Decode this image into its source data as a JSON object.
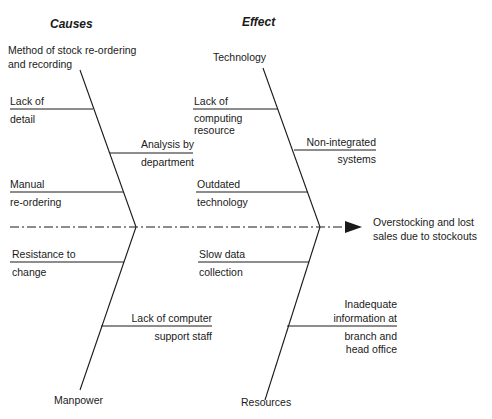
{
  "headers": {
    "causes": "Causes",
    "effect": "Effect"
  },
  "effect_label": {
    "line1": "Overstocking and lost",
    "line2": "sales due to stockouts"
  },
  "categories": {
    "method": {
      "line1": "Method of stock re-ordering",
      "line2": "and recording"
    },
    "technology": "Technology",
    "manpower": "Manpower",
    "resources": "Resources"
  },
  "causes": {
    "lack_of_detail": {
      "line1": "Lack of",
      "line2": "detail"
    },
    "analysis_by_department": {
      "line1": "Analysis by",
      "line2": "department"
    },
    "manual_reordering": {
      "line1": "Manual",
      "line2": "re-ordering"
    },
    "lack_of_computing_resource": {
      "line1": "Lack of",
      "line2": "computing",
      "line3": "resource"
    },
    "non_integrated_systems": {
      "line1": "Non-integrated",
      "line2": "systems"
    },
    "outdated_technology": {
      "line1": "Outdated",
      "line2": "technology"
    },
    "resistance_to_change": {
      "line1": "Resistance to",
      "line2": "change"
    },
    "lack_of_computer_support_staff": {
      "line1": "Lack of computer",
      "line2": "support staff"
    },
    "slow_data_collection": {
      "line1": "Slow data",
      "line2": "collection"
    },
    "inadequate_information": {
      "line1": "Inadequate",
      "line2": "information at",
      "line3": "branch and",
      "line4": "head office"
    }
  },
  "colors": {
    "ink": "#1a1a1a",
    "background": "#ffffff"
  }
}
